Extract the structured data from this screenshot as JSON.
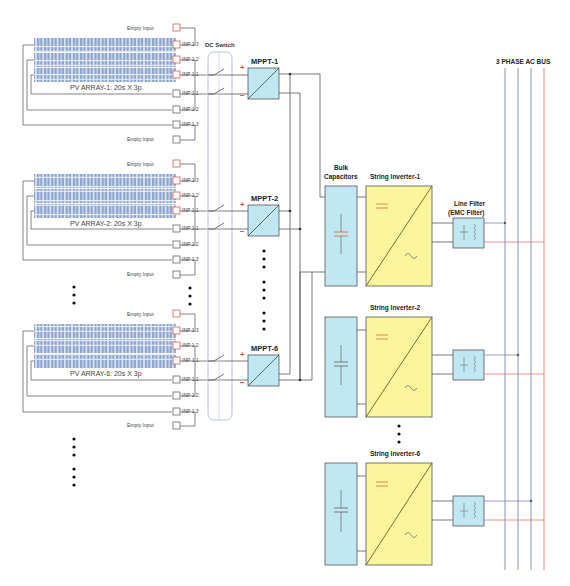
{
  "labels": {
    "dc_switch": "DC Switch",
    "ac_bus": "3 PHASE AC BUS",
    "bulk_capacitors_line1": "Bulk",
    "bulk_capacitors_line2": "Capacitors",
    "line_filter_line1": "Line Filter",
    "line_filter_line2": "(EMC Filter)",
    "empty_input": "Empty Input"
  },
  "pv_arrays": [
    {
      "name": "PV ARRAY-1: 20s X 3p",
      "inputs": [
        "INP 1.3",
        "INP 1.2",
        "INP 1.1",
        "INP 1.1",
        "INP 1.2",
        "INP 1.3"
      ]
    },
    {
      "name": "PV ARRAY-2: 20s X 3p",
      "inputs": [
        "INP 1.3",
        "INP 1.2",
        "INP 1.1",
        "INP 1.1",
        "INP 1.2",
        "INP 1.3"
      ]
    },
    {
      "name": "PV ARRAY-6: 20s X 3p",
      "inputs": [
        "INP 1.3",
        "INP 1.2",
        "INP 1.1",
        "INP 1.1",
        "INP 1.2",
        "INP 1.3"
      ]
    }
  ],
  "mppts": [
    {
      "name": "MPPT-1",
      "plus": "+",
      "minus": "−"
    },
    {
      "name": "MPPT-2",
      "plus": "+",
      "minus": "−"
    },
    {
      "name": "MPPT-6",
      "plus": "+",
      "minus": "−"
    }
  ],
  "inverters": [
    {
      "name": "String Inverter-1",
      "dc_symbol": "=",
      "ac_symbol": "~"
    },
    {
      "name": "String Inverter-2",
      "dc_symbol": "=",
      "ac_symbol": "~"
    },
    {
      "name": "String Inverter-6",
      "dc_symbol": "=",
      "ac_symbol": "~"
    }
  ],
  "colors": {
    "panel": "#6f8fbf",
    "converter_fill": "#bfe8f2",
    "inverter_fill": "#fbf59c",
    "wire": "#555555",
    "bus_blue": "#7a86b8",
    "bus_red": "#e07a6a",
    "plus_red": "#e04a3a"
  }
}
